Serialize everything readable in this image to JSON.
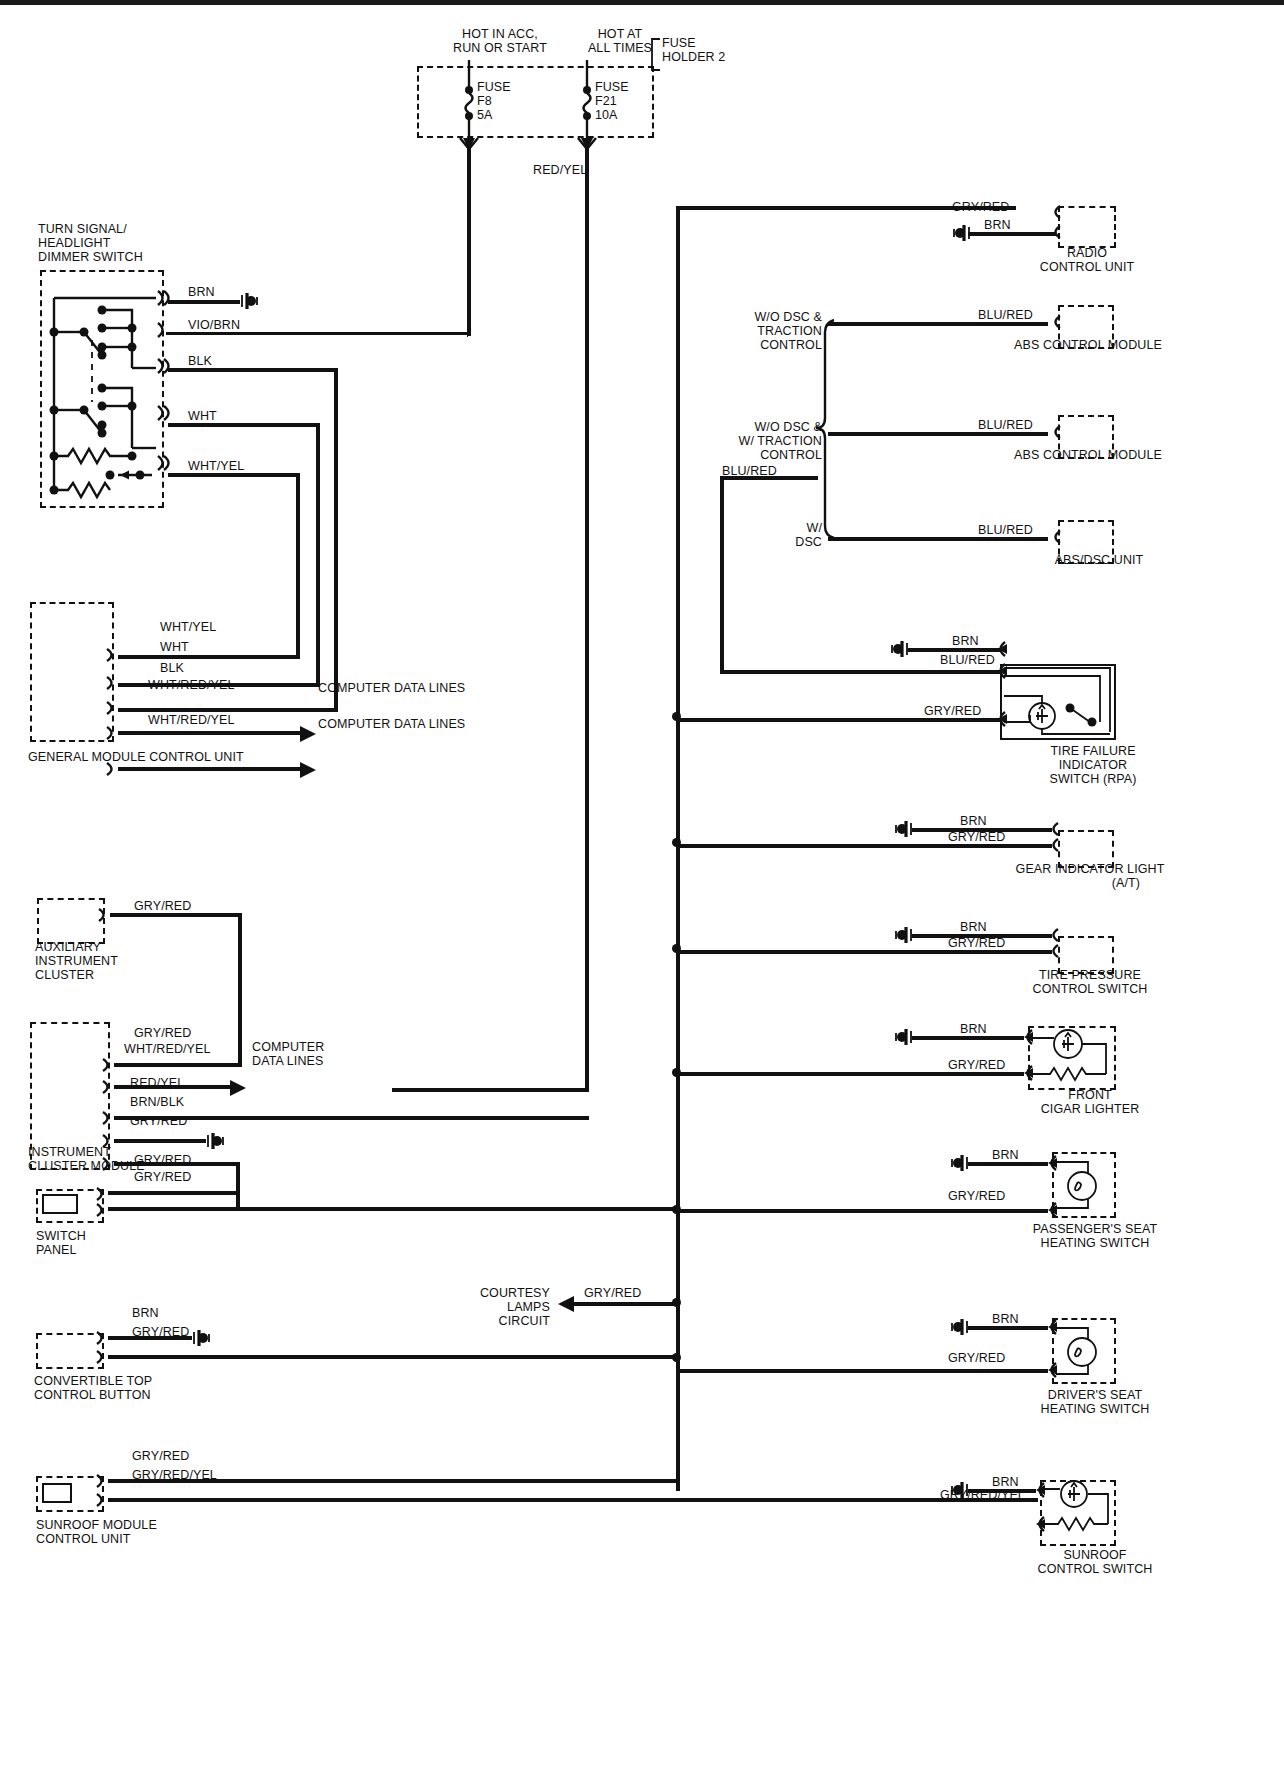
{
  "diagram": {
    "type": "wiring-schematic"
  },
  "power": {
    "hot_acc": "HOT IN ACC,\nRUN OR START",
    "hot_all": "HOT AT\nALL TIMES",
    "holder": "FUSE\nHOLDER 2",
    "fuse_f8": "FUSE\nF8\n5A",
    "fuse_f21": "FUSE\nF21\n10A",
    "red_yel": "RED/YEL"
  },
  "left": {
    "turn_switch": {
      "name": "TURN SIGNAL/\nHEADLIGHT\nDIMMER SWITCH",
      "wires": [
        "BRN",
        "VIO/BRN",
        "BLK",
        "WHT",
        "WHT/YEL"
      ]
    },
    "general_module": {
      "name": "GENERAL MODULE CONTROL UNIT",
      "wires": [
        "WHT/YEL",
        "WHT",
        "BLK",
        "WHT/RED/YEL",
        "WHT/RED/YEL"
      ],
      "data_line_1": "COMPUTER DATA LINES",
      "data_line_2": "COMPUTER DATA LINES"
    },
    "aux_cluster": {
      "name": "AUXILIARY\nINSTRUMENT\nCLUSTER",
      "wire": "GRY/RED"
    },
    "instrument_cluster": {
      "name": "INSTRUMENT\nCLUSTER MODULE",
      "wires": [
        "GRY/RED",
        "WHT/RED/YEL",
        "RED/YEL",
        "BRN/BLK",
        "GRY/RED"
      ],
      "data_lines": "COMPUTER\nDATA LINES"
    },
    "switch_panel": {
      "name": "SWITCH\nPANEL",
      "wires": [
        "GRY/RED",
        "GRY/RED"
      ]
    },
    "convertible": {
      "name": "CONVERTIBLE TOP\nCONTROL BUTTON",
      "wires": [
        "BRN",
        "GRY/RED"
      ]
    },
    "sunroof_module": {
      "name": "SUNROOF MODULE\nCONTROL UNIT",
      "wires": [
        "GRY/RED",
        "GRY/RED/YEL"
      ]
    },
    "courtesy": {
      "label": "COURTESY\nLAMPS\nCIRCUIT",
      "wire": "GRY/RED"
    }
  },
  "right": {
    "radio": {
      "name": "RADIO\nCONTROL UNIT",
      "wires": [
        "GRY/RED",
        "BRN"
      ]
    },
    "abs1": {
      "name": "ABS CONTROL MODULE",
      "option": "W/O DSC &\nTRACTION\nCONTROL",
      "wire": "BLU/RED"
    },
    "abs2": {
      "name": "ABS CONTROL MODULE",
      "option": "W/O DSC &\nW/ TRACTION\nCONTROL",
      "wire": "BLU/RED"
    },
    "abs3": {
      "name": "ABS/DSC UNIT",
      "option": "W/\nDSC",
      "wire": "BLU/RED"
    },
    "branch_label": "BLU/RED",
    "tire_failure": {
      "name": "TIRE FAILURE\nINDICATOR\nSWITCH (RPA)",
      "wires": [
        "BRN",
        "BLU/RED",
        "GRY/RED"
      ]
    },
    "gear_indicator": {
      "name": "GEAR INDICATOR LIGHT",
      "sub": "(A/T)",
      "wires": [
        "BRN",
        "GRY/RED"
      ]
    },
    "tire_pressure": {
      "name": "TIRE PRESSURE\nCONTROL SWITCH",
      "wires": [
        "BRN",
        "GRY/RED"
      ]
    },
    "cigar": {
      "name": "FRONT\nCIGAR LIGHTER",
      "wires": [
        "BRN",
        "GRY/RED"
      ]
    },
    "pass_seat": {
      "name": "PASSENGER'S SEAT\nHEATING SWITCH",
      "wires": [
        "BRN",
        "GRY/RED"
      ]
    },
    "driver_seat": {
      "name": "DRIVER'S SEAT\nHEATING SWITCH",
      "wires": [
        "BRN",
        "GRY/RED"
      ]
    },
    "sunroof_switch": {
      "name": "SUNROOF\nCONTROL SWITCH",
      "wires": [
        "BRN",
        "GRY/RED/YEL"
      ]
    }
  },
  "icons": {
    "ground": "ground-symbol",
    "connector": "connector-symbol",
    "arrow": "arrow-symbol",
    "fuse": "fuse-symbol",
    "lamp": "lamp-symbol",
    "resistor": "resistor-symbol",
    "led": "led-symbol"
  }
}
